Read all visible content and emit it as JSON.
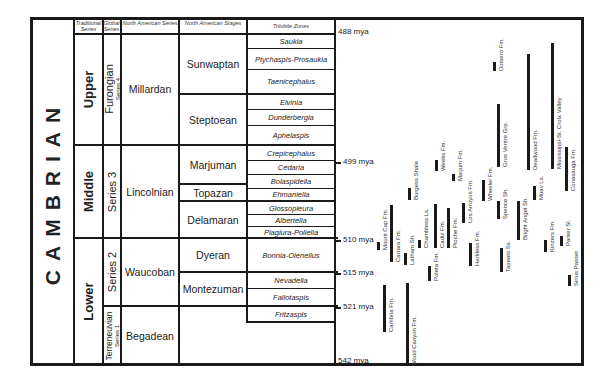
{
  "headers": {
    "traditional": "Traditional Series",
    "global": "Global Series",
    "na_series": "North American Series",
    "na_stages": "North American Stages",
    "trilobite": "Trilobite Zones"
  },
  "period": "CAMBRIAN",
  "traditional_series": [
    {
      "label": "Upper",
      "top": 23,
      "bottom": 145
    },
    {
      "label": "Middle",
      "top": 145,
      "bottom": 238
    },
    {
      "label": "Lower",
      "top": 238,
      "bottom": 366
    }
  ],
  "global_series": [
    {
      "label": "Furongian",
      "sub": "Series 4",
      "top": 23,
      "bottom": 145
    },
    {
      "label": "Series 3",
      "sub": "",
      "top": 145,
      "bottom": 238
    },
    {
      "label": "Series 2",
      "sub": "",
      "top": 238,
      "bottom": 306
    },
    {
      "label": "Terreneuvian",
      "sub": "Series 1",
      "top": 306,
      "bottom": 366
    }
  ],
  "na_series": [
    {
      "label": "Millardan",
      "top": 23,
      "bottom": 145
    },
    {
      "label": "Lincolnian",
      "top": 145,
      "bottom": 238
    },
    {
      "label": "Waucoban",
      "top": 238,
      "bottom": 306
    },
    {
      "label": "Begadean",
      "top": 306,
      "bottom": 366
    }
  ],
  "na_stages": [
    {
      "label": "Sunwaptan",
      "top": 23,
      "bottom": 94
    },
    {
      "label": "Steptoean",
      "top": 94,
      "bottom": 145
    },
    {
      "label": "Marjuman",
      "top": 145,
      "bottom": 184
    },
    {
      "label": "Topazan",
      "top": 184,
      "bottom": 201
    },
    {
      "label": "Delamaran",
      "top": 201,
      "bottom": 238
    },
    {
      "label": "Dyeran",
      "top": 238,
      "bottom": 272
    },
    {
      "label": "Montezuman",
      "top": 272,
      "bottom": 306
    }
  ],
  "trilobite_zones": [
    {
      "label": "Saukia",
      "top": 23,
      "bottom": 48
    },
    {
      "label": "Ptychaspis-Prosaukia",
      "top": 48,
      "bottom": 69
    },
    {
      "label": "Taenicephalus",
      "top": 69,
      "bottom": 94
    },
    {
      "label": "Elvinia",
      "top": 94,
      "bottom": 109
    },
    {
      "label": "Dunderbergia",
      "top": 109,
      "bottom": 125
    },
    {
      "label": "Aphelaspis",
      "top": 125,
      "bottom": 145
    },
    {
      "label": "Crepicephalus",
      "top": 145,
      "bottom": 160
    },
    {
      "label": "Cedaria",
      "top": 160,
      "bottom": 174
    },
    {
      "label": "Bolaspidella",
      "top": 174,
      "bottom": 188
    },
    {
      "label": "Ehmaniella",
      "top": 188,
      "bottom": 201
    },
    {
      "label": "Glossopleura",
      "top": 201,
      "bottom": 214
    },
    {
      "label": "Albertella",
      "top": 214,
      "bottom": 226
    },
    {
      "label": "Plagiura-Poliella",
      "top": 226,
      "bottom": 238
    },
    {
      "label": "Bonnia-Olenellus",
      "top": 238,
      "bottom": 272
    },
    {
      "label": "Nevadella",
      "top": 272,
      "bottom": 288
    },
    {
      "label": "Fallotaspis",
      "top": 288,
      "bottom": 306
    },
    {
      "label": "Fritzaspis",
      "top": 306,
      "bottom": 322
    }
  ],
  "ages": [
    {
      "label": "488 mya",
      "y": 23
    },
    {
      "label": "499 mya",
      "y": 162
    },
    {
      "label": "510 mya",
      "y": 240
    },
    {
      "label": "515 mya",
      "y": 273
    },
    {
      "label": "521 mya",
      "y": 307
    },
    {
      "label": "542 mya",
      "y": 360
    }
  ],
  "formations": [
    {
      "label": "Mount Cap Fm.",
      "x": 377,
      "top": 242,
      "bottom": 250
    },
    {
      "label": "Carrara Fm.",
      "x": 390,
      "top": 205,
      "bottom": 262
    },
    {
      "label": "Latham Sh.",
      "x": 404,
      "top": 253,
      "bottom": 265
    },
    {
      "label": "Cambria Fm.",
      "x": 383,
      "top": 285,
      "bottom": 332
    },
    {
      "label": "Wood Canyon Fm.",
      "x": 406,
      "top": 283,
      "bottom": 366
    },
    {
      "label": "Burgess Shale",
      "x": 408,
      "top": 188,
      "bottom": 200
    },
    {
      "label": "Chambless Ls.",
      "x": 418,
      "top": 240,
      "bottom": 248
    },
    {
      "label": "Poleta Fm.",
      "x": 428,
      "top": 266,
      "bottom": 281
    },
    {
      "label": "Cadiz Fm.",
      "x": 434,
      "top": 204,
      "bottom": 248
    },
    {
      "label": "Pioche Fm.",
      "x": 447,
      "top": 208,
      "bottom": 248
    },
    {
      "label": "Weeks Fm.",
      "x": 435,
      "top": 160,
      "bottom": 171
    },
    {
      "label": "Marjum Fm.",
      "x": 452,
      "top": 174,
      "bottom": 181
    },
    {
      "label": "Los Arroyos Fm.",
      "x": 462,
      "top": 203,
      "bottom": 223
    },
    {
      "label": "Harkless Fm.",
      "x": 469,
      "top": 243,
      "bottom": 266
    },
    {
      "label": "Wheeler Fm.",
      "x": 482,
      "top": 180,
      "bottom": 201
    },
    {
      "label": "Tapeats Ss.",
      "x": 500,
      "top": 248,
      "bottom": 272
    },
    {
      "label": "Spence Sh.",
      "x": 497,
      "top": 201,
      "bottom": 219
    },
    {
      "label": "Bright Angel Sh.",
      "x": 517,
      "top": 201,
      "bottom": 240
    },
    {
      "label": "Gros Ventre Grp.",
      "x": 497,
      "top": 104,
      "bottom": 167
    },
    {
      "label": "Dotsero Fm.",
      "x": 493,
      "top": 62,
      "bottom": 71
    },
    {
      "label": "Deadwood Fm.",
      "x": 527,
      "top": 54,
      "bottom": 170
    },
    {
      "label": "Muav Ls.",
      "x": 533,
      "top": 186,
      "bottom": 200
    },
    {
      "label": "Kinzers Fm.",
      "x": 544,
      "top": 240,
      "bottom": 252
    },
    {
      "label": "Parker Sl.",
      "x": 560,
      "top": 236,
      "bottom": 246
    },
    {
      "label": "Mississippi-St. Croix Valley",
      "x": 551,
      "top": 43,
      "bottom": 169
    },
    {
      "label": "Conasauga Fm.",
      "x": 565,
      "top": 147,
      "bottom": 191
    },
    {
      "label": "Sirius Passet",
      "x": 568,
      "top": 275,
      "bottom": 286
    }
  ]
}
